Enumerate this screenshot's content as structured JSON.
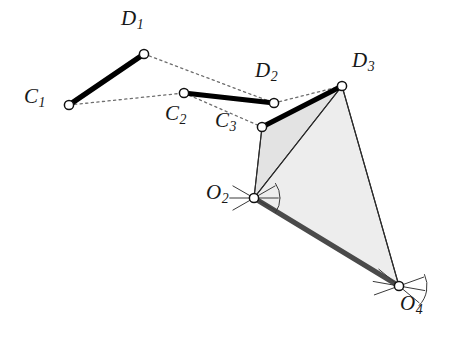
{
  "figure": {
    "width": 451,
    "height": 341,
    "background": "#ffffff"
  },
  "colors": {
    "coupler_link": "#000000",
    "ground_link": "#4a4a4a",
    "dotted_path": "#6e6e6e",
    "triangle_near_fill": "#e3e3e3",
    "triangle_far_fill": "#ededed",
    "triangle_stroke": "#2b2b2b",
    "joint_stroke": "#111111",
    "joint_fill": "#ffffff",
    "label_color": "#181818",
    "pivot_hatch": "#3a3a3a"
  },
  "nodes": [
    {
      "id": "C1",
      "label": "C",
      "subscript": "1",
      "x": 69,
      "y": 105,
      "label_x": 24,
      "label_y": 86,
      "type": "moving-pivot"
    },
    {
      "id": "D1",
      "label": "D",
      "subscript": "1",
      "x": 144,
      "y": 54,
      "label_x": 121,
      "label_y": 8,
      "type": "moving-pivot"
    },
    {
      "id": "C2",
      "label": "C",
      "subscript": "2",
      "x": 184,
      "y": 93,
      "label_x": 165,
      "label_y": 103,
      "type": "moving-pivot"
    },
    {
      "id": "D2",
      "label": "D",
      "subscript": "2",
      "x": 274,
      "y": 103,
      "label_x": 255,
      "label_y": 60,
      "type": "moving-pivot"
    },
    {
      "id": "C3",
      "label": "C",
      "subscript": "3",
      "x": 262,
      "y": 127,
      "label_x": 215,
      "label_y": 110,
      "type": "moving-pivot"
    },
    {
      "id": "D3",
      "label": "D",
      "subscript": "3",
      "x": 342,
      "y": 86,
      "label_x": 352,
      "label_y": 50,
      "type": "moving-pivot"
    },
    {
      "id": "O2",
      "label": "O",
      "subscript": "2",
      "x": 254,
      "y": 198,
      "label_x": 206,
      "label_y": 182,
      "type": "ground-pivot"
    },
    {
      "id": "O4",
      "label": "O",
      "subscript": "4",
      "x": 399,
      "y": 286,
      "label_x": 400,
      "label_y": 293,
      "type": "ground-pivot"
    }
  ],
  "coupler_links": [
    {
      "name": "link-C1-D1",
      "from": "C1",
      "to": "D1"
    },
    {
      "name": "link-C2-D2",
      "from": "C2",
      "to": "D2"
    },
    {
      "name": "link-C3-D3",
      "from": "C3",
      "to": "D3"
    }
  ],
  "ground_links": [
    {
      "name": "link-O2-O4",
      "from": "O2",
      "to": "O4"
    }
  ],
  "dotted_paths": [
    {
      "name": "path-C1-C2",
      "from": "C1",
      "to": "C2"
    },
    {
      "name": "path-C2-C3",
      "from": "C2",
      "to": "C3"
    },
    {
      "name": "path-D1-D2",
      "from": "D1",
      "to": "D2"
    },
    {
      "name": "path-D2-D3",
      "from": "D2",
      "to": "D3"
    }
  ],
  "triangles": [
    {
      "name": "triangle-C3-D3-O2",
      "vertices": [
        "C3",
        "D3",
        "O2"
      ],
      "fill_key": "triangle_near_fill"
    },
    {
      "name": "triangle-D3-O2-O4",
      "vertices": [
        "D3",
        "O2",
        "O4"
      ],
      "fill_key": "triangle_far_fill"
    }
  ],
  "connector_lines": [
    {
      "name": "line-C3-O2",
      "from": "C3",
      "to": "O2"
    },
    {
      "name": "line-D3-O2",
      "from": "D3",
      "to": "O2"
    },
    {
      "name": "line-D3-O4",
      "from": "D3",
      "to": "O4"
    },
    {
      "name": "line-O2-O4-thin",
      "from": "O2",
      "to": "O4"
    }
  ],
  "pivot_hatch_marks": {
    "O2": {
      "arcs": 2,
      "rays": 3,
      "radius": 26
    },
    "O4": {
      "arcs": 2,
      "rays": 3,
      "radius": 28
    }
  },
  "joint_radius": 4.6,
  "stroke_widths": {
    "coupler_link": 5.2,
    "ground_link": 5.0,
    "dotted_path": 1.3,
    "triangle_stroke": 1.1,
    "connector": 1.1,
    "joint": 1.5,
    "hatch": 1.0
  }
}
